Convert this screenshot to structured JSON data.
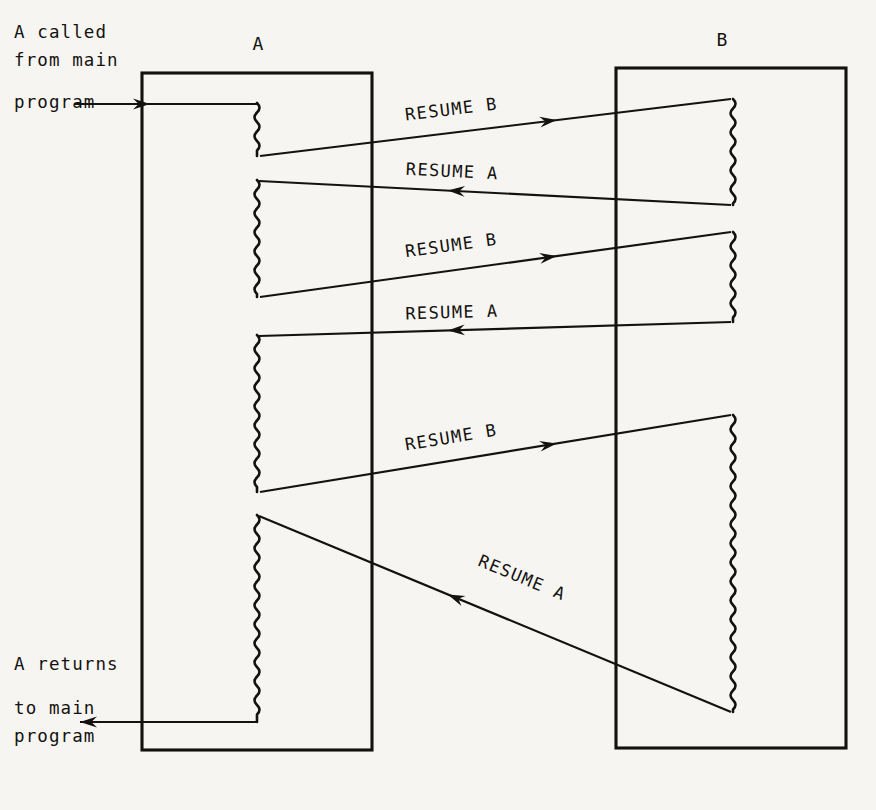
{
  "diagram": {
    "background_color": "#f6f5f2",
    "ink_color": "#14120f",
    "columns": [
      {
        "id": "A",
        "header": "A",
        "header_x": 258,
        "header_y": 50,
        "box": {
          "x": 142,
          "y": 73,
          "w": 230,
          "h": 677
        }
      },
      {
        "id": "B",
        "header": "B",
        "header_x": 722,
        "header_y": 46,
        "box": {
          "x": 616,
          "y": 68,
          "w": 230,
          "h": 680
        }
      }
    ],
    "annotations": [
      {
        "name": "entry-note",
        "lines": [
          "A called",
          "from main",
          "program"
        ],
        "x": 14,
        "y": 38
      },
      {
        "name": "exit-note",
        "lines": [
          "A returns",
          "to main",
          "program"
        ],
        "x": 14,
        "y": 670
      }
    ],
    "entry_arrow": {
      "label": "A called from main program",
      "from_x": 74,
      "to_x": 257,
      "y": 104
    },
    "exit_arrow": {
      "label": "A returns to main program",
      "from_x": 257,
      "to_x": 80,
      "y": 722
    },
    "active_segments": [
      {
        "name": "A-active-1",
        "side": "A",
        "x": 257,
        "y1": 103,
        "y2": 156
      },
      {
        "name": "B-active-1",
        "side": "B",
        "x": 733,
        "y1": 99,
        "y2": 205
      },
      {
        "name": "A-active-2",
        "side": "A",
        "x": 257,
        "y1": 180,
        "y2": 297
      },
      {
        "name": "B-active-2",
        "side": "B",
        "x": 733,
        "y1": 232,
        "y2": 322
      },
      {
        "name": "A-active-3",
        "side": "A",
        "x": 257,
        "y1": 335,
        "y2": 492
      },
      {
        "name": "B-active-3",
        "side": "B",
        "x": 733,
        "y1": 415,
        "y2": 712
      },
      {
        "name": "A-active-4",
        "side": "A",
        "x": 257,
        "y1": 515,
        "y2": 722
      }
    ],
    "transfers": [
      {
        "name": "resume-b-1",
        "label": "RESUME B",
        "direction": "A-to-B",
        "x1": 260,
        "y1": 156,
        "x2": 731,
        "y2": 99,
        "label_x": 452,
        "label_y": 115,
        "angle": -6.9
      },
      {
        "name": "resume-a-1",
        "label": "RESUME A",
        "direction": "B-to-A",
        "x1": 731,
        "y1": 205,
        "x2": 259,
        "y2": 181,
        "label_x": 452,
        "label_y": 177,
        "angle": 2.9
      },
      {
        "name": "resume-b-2",
        "label": "RESUME B",
        "direction": "A-to-B",
        "x1": 260,
        "y1": 297,
        "x2": 731,
        "y2": 232,
        "label_x": 452,
        "label_y": 251,
        "angle": -7.8
      },
      {
        "name": "resume-a-2",
        "label": "RESUME A",
        "direction": "B-to-A",
        "x1": 731,
        "y1": 322,
        "x2": 259,
        "y2": 336,
        "label_x": 452,
        "label_y": 318,
        "angle": -1.7
      },
      {
        "name": "resume-b-3",
        "label": "RESUME B",
        "direction": "A-to-B",
        "x1": 260,
        "y1": 492,
        "x2": 731,
        "y2": 415,
        "label_x": 452,
        "label_y": 443,
        "angle": -9.3
      },
      {
        "name": "resume-a-3",
        "label": "RESUME A",
        "direction": "B-to-A",
        "x1": 731,
        "y1": 712,
        "x2": 259,
        "y2": 516,
        "label_x": 520,
        "label_y": 583,
        "angle": 22.5
      }
    ]
  }
}
